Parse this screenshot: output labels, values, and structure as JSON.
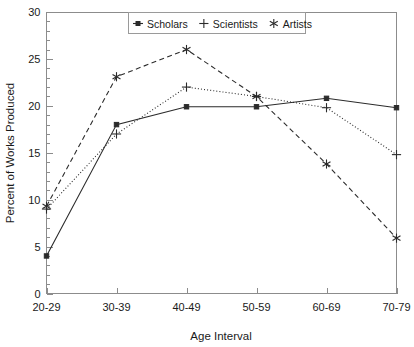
{
  "chart_data": {
    "type": "line",
    "title": "",
    "xlabel": "Age Interval",
    "ylabel": "Percent of Works Produced",
    "categories": [
      "20-29",
      "30-39",
      "40-49",
      "50-59",
      "60-69",
      "70-79"
    ],
    "ylim": [
      0,
      30
    ],
    "yticks": [
      0,
      5,
      10,
      15,
      20,
      25,
      30
    ],
    "ytick_labels": [
      "0",
      "5",
      "10",
      "15",
      "20",
      "25",
      "30"
    ],
    "y_minor_tick_step": 1,
    "grid": false,
    "legend_position": "top-center",
    "series": [
      {
        "name": "Scholars",
        "marker": "square",
        "linestyle": "solid",
        "color": "#2b2b2b",
        "values": [
          4.0,
          18.0,
          19.9,
          19.9,
          20.8,
          19.8
        ]
      },
      {
        "name": "Scientists",
        "marker": "plus",
        "linestyle": "dotted",
        "color": "#2b2b2b",
        "values": [
          9.0,
          17.0,
          22.0,
          21.0,
          19.8,
          14.8
        ]
      },
      {
        "name": "Artists",
        "marker": "asterisk",
        "linestyle": "dashed",
        "color": "#2b2b2b",
        "values": [
          9.3,
          23.1,
          26.0,
          21.0,
          13.8,
          5.9
        ]
      }
    ]
  },
  "legend": {
    "entries": [
      {
        "label": "Scholars"
      },
      {
        "label": "Scientists"
      },
      {
        "label": "Artists"
      }
    ]
  },
  "axes": {
    "y_title": "Percent of Works Produced",
    "x_title": "Age Interval",
    "y_labels": [
      "30",
      "25",
      "20",
      "15",
      "10",
      "5",
      "0"
    ],
    "x_labels": [
      "20-29",
      "30-39",
      "40-49",
      "50-59",
      "60-69",
      "70-79"
    ]
  }
}
